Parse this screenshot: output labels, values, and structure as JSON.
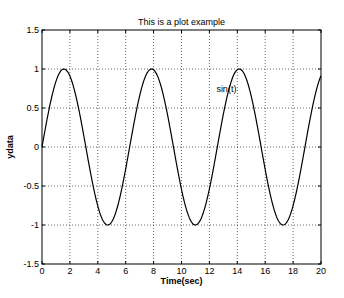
{
  "chart_data": {
    "type": "line",
    "title": "This is a plot example",
    "xlabel": "Time(sec)",
    "ylabel": "ydata",
    "xlim": [
      0,
      20
    ],
    "ylim": [
      -1.5,
      1.5
    ],
    "xticks": [
      0,
      2,
      4,
      6,
      8,
      10,
      12,
      14,
      16,
      18,
      20
    ],
    "yticks": [
      -1.5,
      -1,
      -0.5,
      0,
      0.5,
      1,
      1.5
    ],
    "xtick_labels": [
      "0",
      "2",
      "4",
      "6",
      "8",
      "10",
      "12",
      "14",
      "16",
      "18",
      "20"
    ],
    "ytick_labels": [
      "-1.5",
      "-1",
      "-0.5",
      "0",
      "0.5",
      "1",
      "1.5"
    ],
    "grid": true,
    "grid_style": "dotted",
    "series": [
      {
        "name": "sin(t)",
        "function": "sin(t)",
        "t_range": [
          0,
          20
        ],
        "color": "#000000"
      }
    ],
    "annotations": [
      {
        "text": "sin(t)",
        "x": 12.5,
        "y": 0.7
      }
    ],
    "legend": null
  },
  "layout": {
    "axes_px": {
      "left": 42,
      "right": 321,
      "top": 30,
      "bottom": 264
    },
    "colors": {
      "line": "#000000",
      "grid": "#000000",
      "background": "#ffffff"
    }
  }
}
